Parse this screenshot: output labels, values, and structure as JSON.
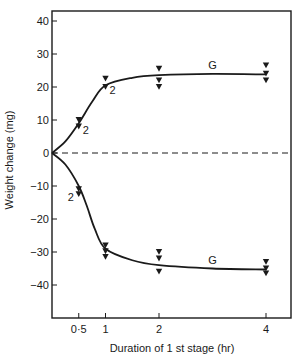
{
  "chart_data": {
    "type": "line",
    "title": "",
    "xlabel": "Duration of 1 st stage  (hr)",
    "ylabel": "Weight change  (mg)",
    "xlim": [
      0,
      4.7
    ],
    "ylim": [
      -50,
      45
    ],
    "x_ticks": [
      {
        "value": 0.5,
        "label": "0·5"
      },
      {
        "value": 1,
        "label": "1"
      },
      {
        "value": 2,
        "label": "2"
      },
      {
        "value": 4,
        "label": "4"
      }
    ],
    "y_ticks": [
      {
        "value": 40,
        "label": "40"
      },
      {
        "value": 30,
        "label": "30"
      },
      {
        "value": 20,
        "label": "20"
      },
      {
        "value": 10,
        "label": "10"
      },
      {
        "value": 0,
        "label": "0"
      },
      {
        "value": -10,
        "label": "−10"
      },
      {
        "value": -20,
        "label": "−20"
      },
      {
        "value": -30,
        "label": "−30"
      },
      {
        "value": -40,
        "label": "−40"
      }
    ],
    "grid": false,
    "reference_line": {
      "y": 0,
      "style": "dashed"
    },
    "series": [
      {
        "name": "Weight gain",
        "curve_label": "G",
        "curve": [
          [
            0,
            0
          ],
          [
            0.25,
            3.5
          ],
          [
            0.5,
            9
          ],
          [
            0.75,
            15.5
          ],
          [
            1,
            20.5
          ],
          [
            1.5,
            22.8
          ],
          [
            2,
            23.6
          ],
          [
            3,
            24
          ],
          [
            4,
            23.8
          ]
        ],
        "points": [
          {
            "x": 0.5,
            "y": 10
          },
          {
            "x": 0.5,
            "y": 8,
            "label": "2"
          },
          {
            "x": 1,
            "y": 22.5
          },
          {
            "x": 1,
            "y": 20,
            "label": "2"
          },
          {
            "x": 2,
            "y": 25.5
          },
          {
            "x": 2,
            "y": 22
          },
          {
            "x": 2,
            "y": 20
          },
          {
            "x": 4,
            "y": 26.5
          },
          {
            "x": 4,
            "y": 24
          },
          {
            "x": 4,
            "y": 22
          }
        ]
      },
      {
        "name": "Weight loss",
        "curve_label": "G",
        "curve": [
          [
            0,
            0
          ],
          [
            0.25,
            -3.5
          ],
          [
            0.5,
            -10
          ],
          [
            0.65,
            -16
          ],
          [
            0.8,
            -23
          ],
          [
            1,
            -29
          ],
          [
            1.5,
            -32.5
          ],
          [
            2,
            -34
          ],
          [
            3,
            -35
          ],
          [
            4,
            -35.3
          ]
        ],
        "points": [
          {
            "x": 0.5,
            "y": -11
          },
          {
            "x": 0.5,
            "y": -12.5,
            "label": "2"
          },
          {
            "x": 1,
            "y": -28
          },
          {
            "x": 1,
            "y": -29.8
          },
          {
            "x": 1,
            "y": -31.5
          },
          {
            "x": 2,
            "y": -30
          },
          {
            "x": 2,
            "y": -32
          },
          {
            "x": 2,
            "y": -36
          },
          {
            "x": 4,
            "y": -33
          },
          {
            "x": 4,
            "y": -35
          },
          {
            "x": 4,
            "y": -36.5
          }
        ]
      }
    ],
    "marker": "filled-downward-triangle",
    "colors": {
      "ink": "#1a1a1a",
      "background": "#ffffff"
    }
  }
}
